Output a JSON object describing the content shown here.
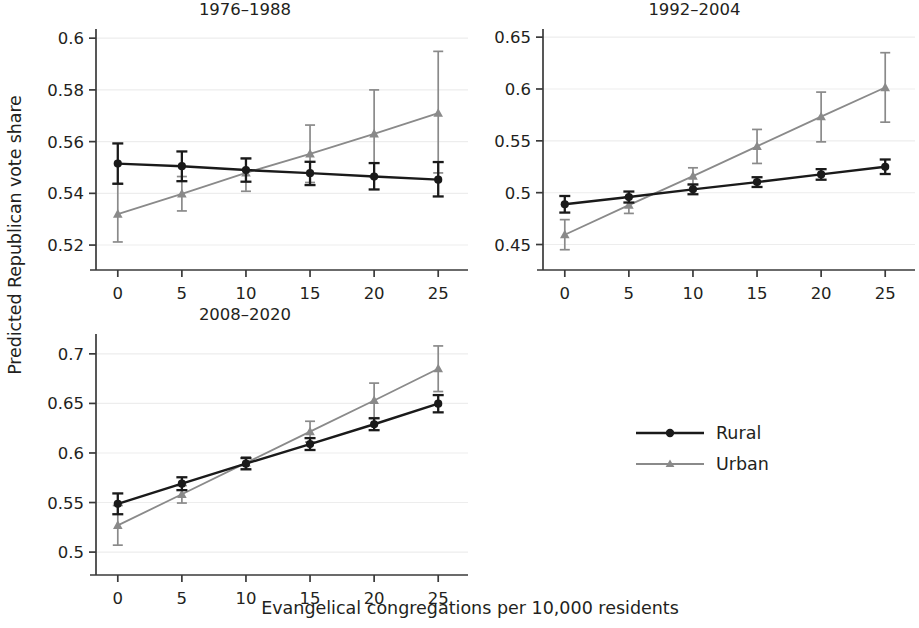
{
  "figure": {
    "ylabel": "Predicted Republican vote share",
    "xlabel": "Evangelical congregations per 10,000 residents"
  },
  "legend": {
    "items": [
      {
        "label": "Rural",
        "color": "#1a1a1a",
        "marker": "circle"
      },
      {
        "label": "Urban",
        "color": "#808080",
        "marker": "triangle"
      }
    ]
  },
  "chart_data": [
    {
      "type": "line",
      "title": "1976–1988",
      "xlabel": "",
      "ylabel": "Predicted Republican vote share",
      "x": [
        0,
        5,
        10,
        15,
        20,
        25
      ],
      "xticks": [
        "0",
        "5",
        "10",
        "15",
        "20",
        "25"
      ],
      "yticks": [
        "0.6",
        "0.58",
        "0.56",
        "0.54",
        "0.52"
      ],
      "ytickvals": [
        0.6,
        0.58,
        0.56,
        0.54,
        0.52
      ],
      "xlim": [
        -1.7,
        26.7
      ],
      "ylim": [
        0.515,
        0.602
      ],
      "grid": true,
      "series": [
        {
          "name": "Rural",
          "color": "#1a1a1a",
          "marker": "circle",
          "values": [
            0.5515,
            0.5505,
            0.549,
            0.5478,
            0.5465,
            0.5453
          ],
          "ci_low": [
            0.5437,
            0.5447,
            0.5445,
            0.5432,
            0.5415,
            0.5388
          ],
          "ci_high": [
            0.5593,
            0.5562,
            0.5535,
            0.5522,
            0.5517,
            0.5521
          ]
        },
        {
          "name": "Urban",
          "color": "#808080",
          "marker": "triangle",
          "values": [
            0.532,
            0.5398,
            0.5479,
            0.5553,
            0.563,
            0.571
          ],
          "ci_low": [
            0.5212,
            0.5332,
            0.5408,
            0.5442,
            0.5464,
            0.5479
          ],
          "ci_high": [
            0.5438,
            0.5465,
            0.5535,
            0.5664,
            0.58,
            0.5949
          ]
        }
      ]
    },
    {
      "type": "line",
      "title": "1992–2004",
      "xlabel": "",
      "ylabel": "",
      "x": [
        0,
        5,
        10,
        15,
        20,
        25
      ],
      "xticks": [
        "0",
        "5",
        "10",
        "15",
        "20",
        "25"
      ],
      "yticks": [
        "0.65",
        "0.6",
        "0.55",
        "0.5",
        "0.45"
      ],
      "ytickvals": [
        0.65,
        0.6,
        0.55,
        0.5,
        0.45
      ],
      "xlim": [
        -1.7,
        26.7
      ],
      "ylim": [
        0.437,
        0.654
      ],
      "grid": true,
      "series": [
        {
          "name": "Rural",
          "color": "#1a1a1a",
          "marker": "circle",
          "values": [
            0.4888,
            0.4958,
            0.5032,
            0.5102,
            0.5176,
            0.525
          ],
          "ci_low": [
            0.4808,
            0.4905,
            0.4985,
            0.5055,
            0.5125,
            0.518
          ],
          "ci_high": [
            0.4968,
            0.5011,
            0.5079,
            0.5149,
            0.5227,
            0.532
          ]
        },
        {
          "name": "Urban",
          "color": "#808080",
          "marker": "triangle",
          "values": [
            0.4594,
            0.488,
            0.516,
            0.5447,
            0.5733,
            0.6014
          ],
          "ci_low": [
            0.445,
            0.48,
            0.508,
            0.5282,
            0.549,
            0.568
          ],
          "ci_high": [
            0.474,
            0.496,
            0.524,
            0.561,
            0.597,
            0.635
          ]
        }
      ]
    },
    {
      "type": "line",
      "title": "2008–2020",
      "xlabel": "Evangelical congregations per 10,000 residents",
      "ylabel": "",
      "x": [
        0,
        5,
        10,
        15,
        20,
        25
      ],
      "xticks": [
        "0",
        "5",
        "10",
        "15",
        "20",
        "25"
      ],
      "yticks": [
        "0.7",
        "0.65",
        "0.6",
        "0.55",
        "0.5"
      ],
      "ytickvals": [
        0.7,
        0.65,
        0.6,
        0.55,
        0.5
      ],
      "xlim": [
        -1.7,
        26.7
      ],
      "ylim": [
        0.489,
        0.716
      ],
      "grid": true,
      "series": [
        {
          "name": "Rural",
          "color": "#1a1a1a",
          "marker": "circle",
          "values": [
            0.5487,
            0.569,
            0.5892,
            0.609,
            0.629,
            0.6497
          ],
          "ci_low": [
            0.5382,
            0.5625,
            0.5835,
            0.603,
            0.623,
            0.641
          ],
          "ci_high": [
            0.5592,
            0.5755,
            0.5949,
            0.615,
            0.635,
            0.6584
          ]
        },
        {
          "name": "Urban",
          "color": "#808080",
          "marker": "triangle",
          "values": [
            0.527,
            0.5583,
            0.59,
            0.6215,
            0.653,
            0.685
          ],
          "ci_low": [
            0.507,
            0.5495,
            0.584,
            0.611,
            0.6355,
            0.662
          ],
          "ci_high": [
            0.547,
            0.5671,
            0.596,
            0.632,
            0.6705,
            0.708
          ]
        }
      ]
    }
  ]
}
